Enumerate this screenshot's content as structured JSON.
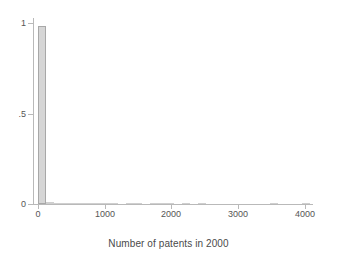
{
  "figure": {
    "background": "#ffffff",
    "bar_fill": "#d6d6d6",
    "bar_edge": "#a8a8a8",
    "axis_color": "#b9b9b9",
    "text_color": "#555555"
  },
  "axes": {
    "y_ticks": [
      {
        "value": 1,
        "label": "1"
      },
      {
        "value": 0.5,
        "label": ".5"
      },
      {
        "value": 0,
        "label": "0"
      }
    ],
    "x_ticks": [
      {
        "value": 0,
        "label": "0"
      },
      {
        "value": 1000,
        "label": "1000"
      },
      {
        "value": 2000,
        "label": "2000"
      },
      {
        "value": 3000,
        "label": "3000"
      },
      {
        "value": 4000,
        "label": "4000"
      }
    ],
    "x_title": "Number of patents in 2000",
    "y_title": ""
  },
  "chart_data": {
    "type": "bar",
    "title": "",
    "subtitle": "",
    "xlabel": "Number of patents in 2000",
    "ylabel": "",
    "xlim": [
      -60,
      4120
    ],
    "ylim": [
      0,
      1.03
    ],
    "grid": false,
    "legend": null,
    "bin_width": 120,
    "note": "Stata histogram of patent counts in 2000; density/fraction on y-axis. First bin dominates at ~0.985, remaining bins are near zero and render as thin dashes along the baseline.",
    "x": [
      60,
      180,
      300,
      420,
      540,
      660,
      780,
      900,
      1020,
      1140,
      1260,
      1380,
      1500,
      1620,
      1740,
      1860,
      1980,
      2100,
      2220,
      2340,
      2460,
      2580,
      2700,
      2820,
      2940,
      3060,
      3180,
      3300,
      3420,
      3540,
      3660,
      3780,
      3900,
      4020
    ],
    "categories": [
      "0-120",
      "120-240",
      "240-360",
      "360-480",
      "480-600",
      "600-720",
      "720-840",
      "840-960",
      "960-1080",
      "1080-1200",
      "1200-1320",
      "1320-1440",
      "1440-1560",
      "1560-1680",
      "1680-1800",
      "1800-1920",
      "1920-2040",
      "2040-2160",
      "2160-2280",
      "2280-2400",
      "2400-2520",
      "2520-2640",
      "2640-2760",
      "2760-2880",
      "2880-3000",
      "3000-3120",
      "3120-3240",
      "3240-3360",
      "3360-3480",
      "3480-3600",
      "3600-3720",
      "3720-3840",
      "3840-3960",
      "3960-4080"
    ],
    "values": [
      0.985,
      0.0105,
      0.0042,
      0.0022,
      0.0014,
      0.001,
      0.0008,
      0.0007,
      0.0006,
      0.0005,
      0.0,
      0.0004,
      0.0004,
      0.0,
      0.0004,
      0.0004,
      0.0004,
      0.0,
      0.0004,
      0.0,
      0.0004,
      0.0,
      0.0,
      0.0,
      0.0,
      0.0,
      0.0,
      0.0,
      0.0,
      0.0004,
      0.0,
      0.0,
      0.0,
      0.0004
    ]
  }
}
